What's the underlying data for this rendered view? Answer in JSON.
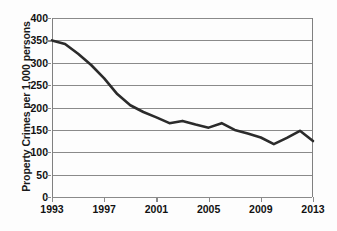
{
  "chart_data": {
    "type": "line",
    "title": "",
    "xlabel": "",
    "ylabel": "Property Crimes per 1,000 persons",
    "xlim": [
      1993,
      2013
    ],
    "ylim": [
      0,
      400
    ],
    "grid": true,
    "legend": false,
    "y_ticks": [
      0,
      50,
      100,
      150,
      200,
      250,
      300,
      350,
      400
    ],
    "y_tick_labels": [
      "0",
      "50",
      "100",
      "150",
      "200",
      "250",
      "300",
      "350",
      "400"
    ],
    "x_ticks": [
      1993,
      1997,
      2001,
      2005,
      2009,
      2013
    ],
    "x_tick_labels": [
      "1993",
      "1997",
      "2001",
      "2005",
      "2009",
      "2013"
    ],
    "series": [
      {
        "name": "Property Crimes per 1,000 persons",
        "color": "#2b2b2b",
        "line_width": 2.6,
        "x": [
          1993,
          1994,
          1995,
          1996,
          1997,
          1998,
          1999,
          2000,
          2001,
          2002,
          2003,
          2004,
          2005,
          2006,
          2007,
          2008,
          2009,
          2010,
          2011,
          2012,
          2013
        ],
        "values": [
          350,
          342,
          320,
          295,
          265,
          230,
          205,
          190,
          178,
          165,
          170,
          162,
          155,
          165,
          150,
          142,
          133,
          118,
          132,
          148,
          125
        ]
      }
    ]
  },
  "axes": {
    "y_title": "Property Crimes per 1,000 persons"
  }
}
